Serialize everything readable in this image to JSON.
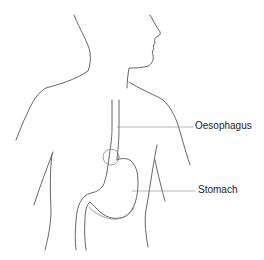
{
  "diagram": {
    "labels": [
      {
        "id": "oesophagus",
        "text": "Oesophagus"
      },
      {
        "id": "stomach",
        "text": "Stomach"
      }
    ],
    "colors": {
      "line": "#555555",
      "background": "#ffffff",
      "text": "#222222"
    }
  }
}
